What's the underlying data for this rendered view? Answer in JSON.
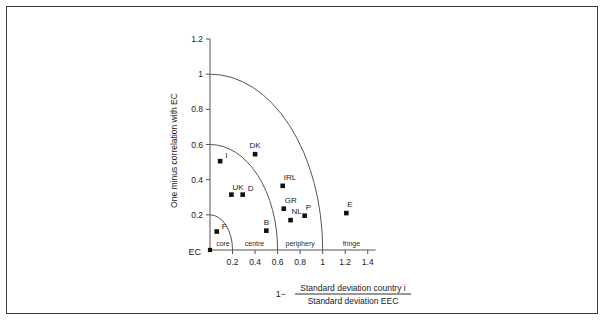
{
  "chart_data": {
    "type": "scatter",
    "title": "",
    "xlabel": "1− Standard deviation country i / Standard deviation EEC",
    "ylabel": "One minus correlation with EC",
    "xlim": [
      0,
      1.5
    ],
    "ylim": [
      0,
      1.2
    ],
    "grid": false,
    "legend": "none",
    "xticks": [
      "0.2",
      "0.4",
      "0.6",
      "0.8",
      "1",
      "1.2",
      "1.4"
    ],
    "xtick_values": [
      0.2,
      0.4,
      0.6,
      0.8,
      1.0,
      1.2,
      1.4
    ],
    "yticks": [
      "0.2",
      "0.4",
      "0.6",
      "0.8",
      "1",
      "1.2"
    ],
    "ytick_values": [
      0.2,
      0.4,
      0.6,
      0.8,
      1.0,
      1.2
    ],
    "origin_label": "EC",
    "points": [
      {
        "label": "EC",
        "x": 0.0,
        "y": 0.0,
        "label_dx": -14,
        "label_dy": 7
      },
      {
        "label": "F",
        "x": 0.06,
        "y": 0.105,
        "label_dx": 5,
        "label_dy": -3
      },
      {
        "label": "I",
        "x": 0.09,
        "y": 0.505,
        "label_dx": 5,
        "label_dy": -3
      },
      {
        "label": "UK",
        "x": 0.19,
        "y": 0.315,
        "label_dx": 1,
        "label_dy": -5
      },
      {
        "label": "D",
        "x": 0.29,
        "y": 0.315,
        "label_dx": 5,
        "label_dy": -4
      },
      {
        "label": "DK",
        "x": 0.4,
        "y": 0.545,
        "label_dx": 0,
        "label_dy": -6
      },
      {
        "label": "B",
        "x": 0.5,
        "y": 0.11,
        "label_dx": 0,
        "label_dy": -6
      },
      {
        "label": "IRL",
        "x": 0.645,
        "y": 0.365,
        "label_dx": 1,
        "label_dy": -6
      },
      {
        "label": "GR",
        "x": 0.655,
        "y": 0.235,
        "label_dx": 1,
        "label_dy": -6
      },
      {
        "label": "NL",
        "x": 0.715,
        "y": 0.17,
        "label_dx": 1,
        "label_dy": -6
      },
      {
        "label": "P",
        "x": 0.84,
        "y": 0.195,
        "label_dx": 1,
        "label_dy": -6
      },
      {
        "label": "E",
        "x": 1.21,
        "y": 0.21,
        "label_dx": 1,
        "label_dy": -6
      }
    ],
    "arcs": [
      {
        "radius": 0.2,
        "name": "core-boundary"
      },
      {
        "radius": 0.6,
        "name": "centre-boundary"
      },
      {
        "radius": 1.0,
        "name": "periphery-boundary"
      }
    ],
    "zones": [
      {
        "label": "core",
        "x": 0.115
      },
      {
        "label": "centre",
        "x": 0.395
      },
      {
        "label": "periphery",
        "x": 0.8
      },
      {
        "label": "fringe",
        "x": 1.255
      }
    ],
    "xlabel_parts": {
      "prefix": "1−",
      "numerator": "Standard deviation country i",
      "denominator": "Standard deviation EEC"
    },
    "colors": {
      "marker": "#111111",
      "axis": "#555555",
      "arc": "#555555",
      "frame": "#3a3a3a",
      "text": "#1a1a1a"
    }
  }
}
